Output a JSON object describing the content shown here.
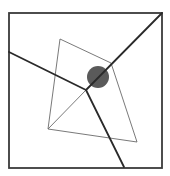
{
  "canvas": {
    "width": 170,
    "height": 176,
    "background": "#ffffff"
  },
  "colors": {
    "frame": "#3a3a3a",
    "thick_line": "#2a2a2a",
    "thin_line": "#6a6a6a",
    "circle": "#5a5a5a"
  },
  "frame": {
    "x": 9,
    "y": 13,
    "width": 153,
    "height": 155
  },
  "quadrilateral": {
    "points": [
      [
        60,
        39
      ],
      [
        111,
        63
      ],
      [
        137,
        142
      ],
      [
        48,
        129
      ]
    ]
  },
  "diagonal_thin": {
    "x1": 48,
    "y1": 129,
    "x2": 86,
    "y2": 90
  },
  "thick_lines": [
    {
      "x1": 9,
      "y1": 52,
      "x2": 86,
      "y2": 90
    },
    {
      "x1": 86,
      "y1": 90,
      "x2": 124,
      "y2": 167
    },
    {
      "x1": 86,
      "y1": 90,
      "x2": 162,
      "y2": 13
    }
  ],
  "junction": {
    "x": 86,
    "y": 90
  },
  "circle": {
    "cx": 98,
    "cy": 77,
    "r": 11
  }
}
